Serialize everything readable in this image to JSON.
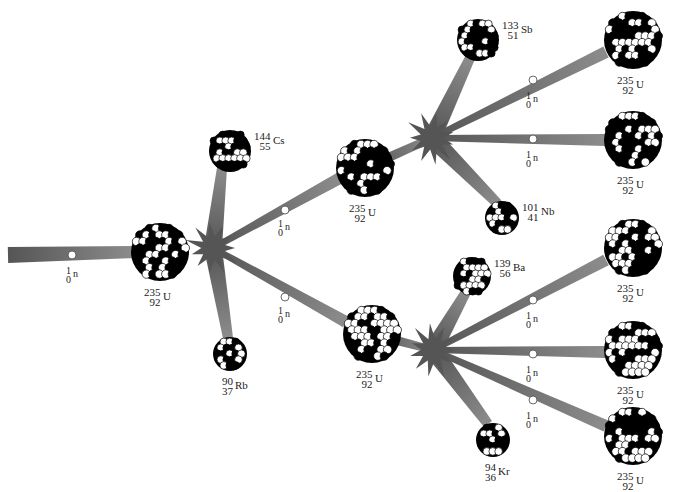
{
  "colors": {
    "beam": "#6e6e6e",
    "beam_light": "#9a9a9a",
    "star": "#555555",
    "nucleon_dark": "#000000",
    "nucleon_light": "#ffffff",
    "neutron": "#ffffff"
  },
  "neutron_label": {
    "mass": "1",
    "number": "0",
    "symbol": "n"
  },
  "nuclei": [
    {
      "id": "u-gen1",
      "mass": "235",
      "number": "92",
      "symbol": "U",
      "x": 160,
      "y": 252,
      "r": 30
    },
    {
      "id": "cs",
      "mass": "144",
      "number": "55",
      "symbol": "Cs",
      "x": 230,
      "y": 151,
      "r": 22
    },
    {
      "id": "rb",
      "mass": "90",
      "number": "37",
      "symbol": "Rb",
      "x": 230,
      "y": 354,
      "r": 18
    },
    {
      "id": "u-gen2-top",
      "mass": "235",
      "number": "92",
      "symbol": "U",
      "x": 365,
      "y": 168,
      "r": 30
    },
    {
      "id": "u-gen2-bottom",
      "mass": "235",
      "number": "92",
      "symbol": "U",
      "x": 372,
      "y": 334,
      "r": 30
    },
    {
      "id": "sb",
      "mass": "133",
      "number": "51",
      "symbol": "Sb",
      "x": 478,
      "y": 40,
      "r": 22
    },
    {
      "id": "nb",
      "mass": "101",
      "number": "41",
      "symbol": "Nb",
      "x": 502,
      "y": 218,
      "r": 18
    },
    {
      "id": "ba",
      "mass": "139",
      "number": "56",
      "symbol": "Ba",
      "x": 472,
      "y": 276,
      "r": 20
    },
    {
      "id": "kr",
      "mass": "94",
      "number": "36",
      "symbol": "Kr",
      "x": 493,
      "y": 440,
      "r": 18
    },
    {
      "id": "u-gen3-1",
      "mass": "235",
      "number": "92",
      "symbol": "U",
      "x": 633,
      "y": 40,
      "r": 30
    },
    {
      "id": "u-gen3-2",
      "mass": "235",
      "number": "92",
      "symbol": "U",
      "x": 633,
      "y": 140,
      "r": 30
    },
    {
      "id": "u-gen3-3",
      "mass": "235",
      "number": "92",
      "symbol": "U",
      "x": 633,
      "y": 248,
      "r": 30
    },
    {
      "id": "u-gen3-4",
      "mass": "235",
      "number": "92",
      "symbol": "U",
      "x": 633,
      "y": 350,
      "r": 30
    },
    {
      "id": "u-gen3-5",
      "mass": "235",
      "number": "92",
      "symbol": "U",
      "x": 633,
      "y": 436,
      "r": 30
    }
  ],
  "explosions": [
    {
      "id": "fission-1",
      "x": 213,
      "y": 248,
      "r": 26
    },
    {
      "id": "fission-2",
      "x": 432,
      "y": 138,
      "r": 26
    },
    {
      "id": "fission-3",
      "x": 433,
      "y": 350,
      "r": 26
    }
  ],
  "neutrons": [
    {
      "id": "n-incoming",
      "x": 72,
      "y": 255,
      "lx": 66,
      "ly": 266
    },
    {
      "id": "n-gen2-top",
      "x": 285,
      "y": 210,
      "lx": 278,
      "ly": 219
    },
    {
      "id": "n-gen2-bottom",
      "x": 285,
      "y": 297,
      "lx": 278,
      "ly": 306
    },
    {
      "id": "n-gen3-1",
      "x": 533,
      "y": 80,
      "lx": 526,
      "ly": 91
    },
    {
      "id": "n-gen3-2",
      "x": 533,
      "y": 139,
      "lx": 526,
      "ly": 150
    },
    {
      "id": "n-gen3-3",
      "x": 533,
      "y": 300,
      "lx": 526,
      "ly": 311
    },
    {
      "id": "n-gen3-4",
      "x": 533,
      "y": 354,
      "lx": 526,
      "ly": 365
    },
    {
      "id": "n-gen3-5",
      "x": 533,
      "y": 400,
      "lx": 526,
      "ly": 411
    }
  ],
  "beams": [
    {
      "from": [
        8,
        255
      ],
      "to": [
        135,
        252
      ],
      "w0": 16,
      "w1": 12
    },
    {
      "from": [
        213,
        248
      ],
      "to": [
        222,
        168
      ],
      "w0": 18,
      "w1": 10
    },
    {
      "from": [
        213,
        248
      ],
      "to": [
        228,
        338
      ],
      "w0": 18,
      "w1": 10
    },
    {
      "from": [
        213,
        248
      ],
      "to": [
        340,
        178
      ],
      "w0": 6,
      "w1": 12
    },
    {
      "from": [
        213,
        248
      ],
      "to": [
        346,
        322
      ],
      "w0": 6,
      "w1": 12
    },
    {
      "from": [
        365,
        168
      ],
      "to": [
        432,
        138
      ],
      "w0": 10,
      "w1": 8
    },
    {
      "from": [
        372,
        334
      ],
      "to": [
        433,
        350
      ],
      "w0": 10,
      "w1": 8
    },
    {
      "from": [
        432,
        138
      ],
      "to": [
        470,
        58
      ],
      "w0": 18,
      "w1": 10
    },
    {
      "from": [
        432,
        138
      ],
      "to": [
        498,
        204
      ],
      "w0": 18,
      "w1": 10
    },
    {
      "from": [
        432,
        138
      ],
      "to": [
        606,
        52
      ],
      "w0": 6,
      "w1": 12
    },
    {
      "from": [
        432,
        138
      ],
      "to": [
        605,
        140
      ],
      "w0": 6,
      "w1": 12
    },
    {
      "from": [
        433,
        350
      ],
      "to": [
        466,
        292
      ],
      "w0": 18,
      "w1": 10
    },
    {
      "from": [
        433,
        350
      ],
      "to": [
        488,
        424
      ],
      "w0": 18,
      "w1": 10
    },
    {
      "from": [
        433,
        350
      ],
      "to": [
        606,
        260
      ],
      "w0": 6,
      "w1": 12
    },
    {
      "from": [
        433,
        350
      ],
      "to": [
        605,
        352
      ],
      "w0": 6,
      "w1": 12
    },
    {
      "from": [
        433,
        350
      ],
      "to": [
        606,
        426
      ],
      "w0": 6,
      "w1": 12
    }
  ]
}
